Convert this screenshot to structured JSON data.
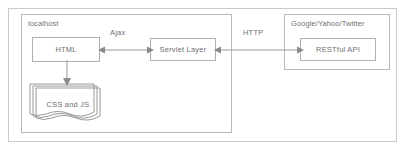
{
  "diagram": {
    "type": "block-diagram",
    "colors": {
      "background": "#ffffff",
      "frame_border": "#c9c9c9",
      "group_border": "#b9b9b9",
      "node_border": "#b0b0b0",
      "connector": "#9a9a9a",
      "text": "#6f6f6f"
    },
    "groups": [
      {
        "id": "localhost",
        "label": "localhost"
      },
      {
        "id": "external",
        "label": "Google/Yahoo/Twitter"
      }
    ],
    "nodes": [
      {
        "id": "html",
        "label": "HTML",
        "shape": "rectangle",
        "group": "localhost"
      },
      {
        "id": "css_js",
        "label": "CSS and JS",
        "shape": "multi-document",
        "group": "localhost"
      },
      {
        "id": "servlet",
        "label": "Servlet Layer",
        "shape": "rectangle",
        "group": "localhost"
      },
      {
        "id": "rest",
        "label": "RESTful API",
        "shape": "rectangle",
        "group": "external"
      }
    ],
    "edges": [
      {
        "id": "ajax",
        "label": "Ajax",
        "from": "html",
        "to": "servlet",
        "direction": "bidirectional"
      },
      {
        "id": "http",
        "label": "HTTP",
        "from": "servlet",
        "to": "rest",
        "direction": "bidirectional"
      },
      {
        "id": "html_css",
        "label": "",
        "from": "html",
        "to": "css_js",
        "direction": "down"
      }
    ]
  }
}
